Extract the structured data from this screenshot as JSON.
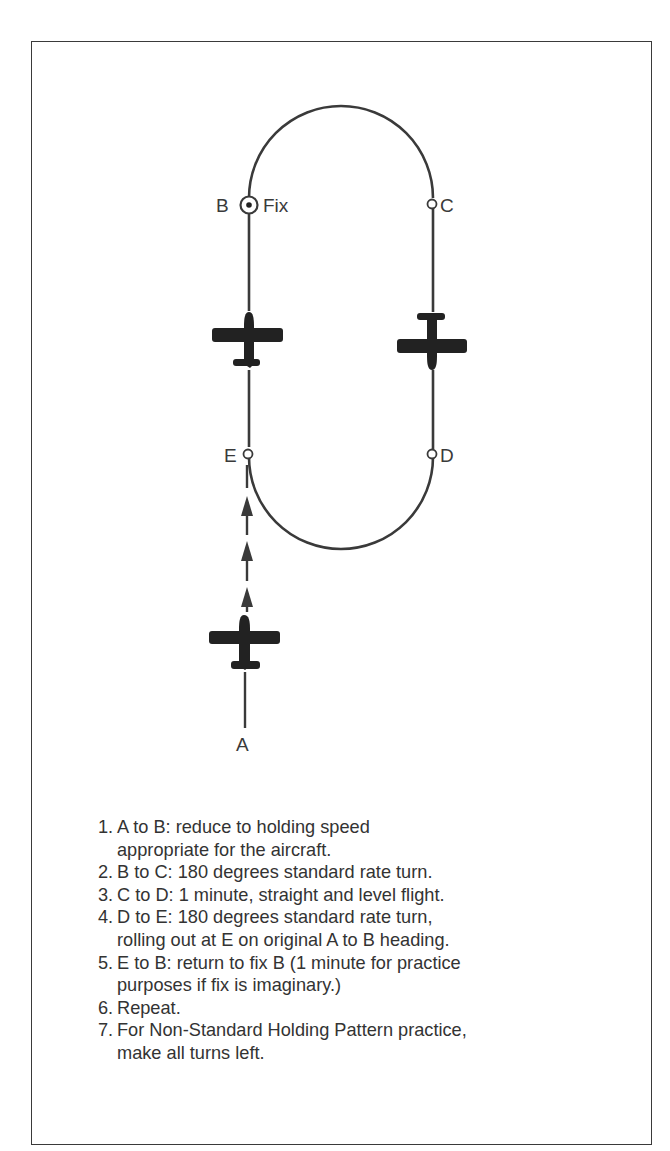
{
  "diagram": {
    "title": "Holding Pattern",
    "points": {
      "A": {
        "label": "A"
      },
      "B": {
        "label": "B",
        "annotation": "Fix"
      },
      "C": {
        "label": "C"
      },
      "D": {
        "label": "D"
      },
      "E": {
        "label": "E"
      }
    },
    "icons": [
      "fix-symbol-icon",
      "airplane-icon",
      "arrow-up-icon"
    ],
    "colors": {
      "line": "#3a3a3a",
      "aircraft": "#222222",
      "background": "#ffffff"
    }
  },
  "steps": [
    {
      "num": "1.",
      "line1": "A to B: reduce to holding speed",
      "line2": "appropriate for the aircraft."
    },
    {
      "num": "2.",
      "line1": "B to C: 180 degrees standard rate turn.",
      "line2": ""
    },
    {
      "num": "3.",
      "line1": "C to D: 1 minute, straight and level flight.",
      "line2": ""
    },
    {
      "num": "4.",
      "line1": "D to E: 180 degrees standard rate turn,",
      "line2": "rolling out at E on original A to B heading."
    },
    {
      "num": "5.",
      "line1": "E to B: return to fix B (1 minute for practice",
      "line2": "purposes if fix is imaginary.)"
    },
    {
      "num": "6.",
      "line1": "Repeat.",
      "line2": ""
    },
    {
      "num": "7.",
      "line1": "For Non-Standard Holding Pattern practice,",
      "line2": "make all turns left."
    }
  ]
}
